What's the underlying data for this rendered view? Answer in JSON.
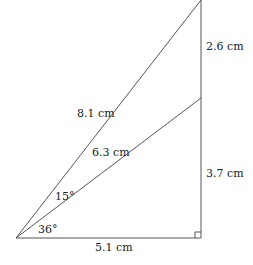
{
  "diagram": {
    "type": "right-triangle-with-cevian",
    "colors": {
      "line": "#555555",
      "text": "#222222",
      "background": "#ffffff"
    },
    "vertices": {
      "origin": [
        16,
        238
      ],
      "right_angle": [
        201,
        238
      ],
      "top": [
        201,
        1
      ],
      "mid": [
        201,
        98
      ]
    },
    "labels": {
      "hypotenuse_outer": "8.1 cm",
      "hypotenuse_inner": "6.3 cm",
      "base": "5.1 cm",
      "vertical_upper": "2.6 cm",
      "vertical_lower": "3.7 cm",
      "angle_upper": "15°",
      "angle_lower": "36°"
    }
  }
}
